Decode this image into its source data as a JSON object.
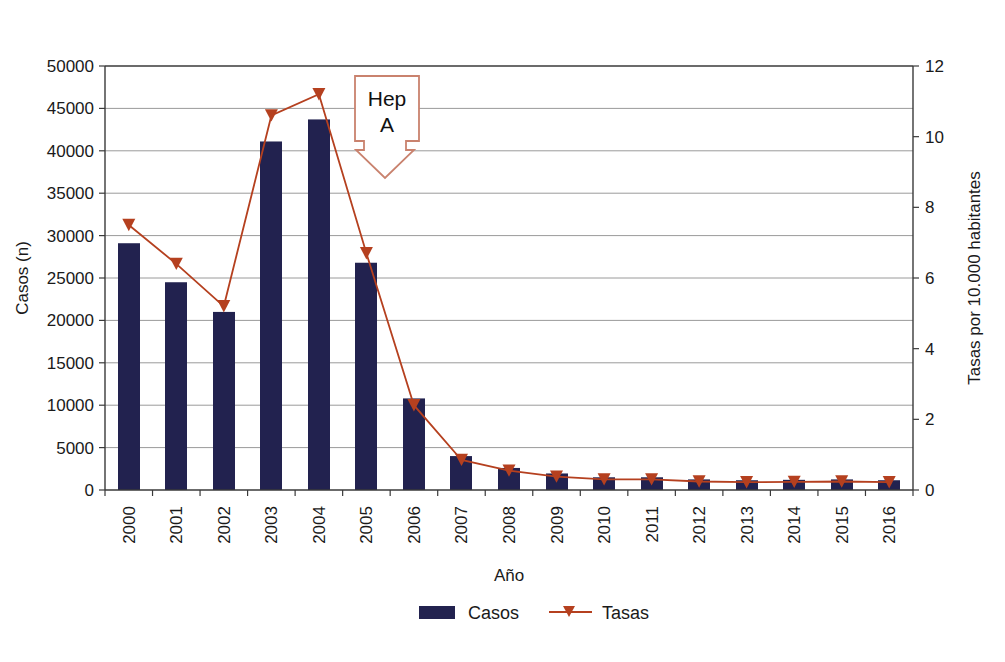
{
  "chart_data": {
    "type": "bar",
    "title": "",
    "subtitle": "",
    "xlabel": "Año",
    "ylabel": "Casos (n)",
    "y2label": "Tasas por 10.000 habitantes",
    "categories": [
      "2000",
      "2001",
      "2002",
      "2003",
      "2004",
      "2005",
      "2006",
      "2007",
      "2008",
      "2009",
      "2010",
      "2011",
      "2012",
      "2013",
      "2014",
      "2015",
      "2016"
    ],
    "ylim": [
      0,
      50000
    ],
    "yticks": [
      0,
      5000,
      10000,
      15000,
      20000,
      25000,
      30000,
      35000,
      40000,
      45000,
      50000
    ],
    "ytick_labels": [
      "0",
      "5000",
      "10000",
      "15000",
      "20000",
      "25000",
      "30000",
      "35000",
      "40000",
      "45000",
      "50000"
    ],
    "y2lim": [
      0,
      12
    ],
    "y2ticks": [
      0,
      2,
      4,
      6,
      8,
      10,
      12
    ],
    "y2tick_labels": [
      "0",
      "2",
      "4",
      "6",
      "8",
      "10",
      "12"
    ],
    "grid": true,
    "legend_position": "bottom",
    "series": [
      {
        "name": "Casos",
        "type": "bar",
        "axis": "left",
        "color": "#22224f",
        "values": [
          29100,
          24500,
          21000,
          41100,
          43700,
          26800,
          10800,
          4000,
          2600,
          1950,
          1500,
          1500,
          1250,
          1150,
          1200,
          1250,
          1150
        ]
      },
      {
        "name": "Tasas",
        "type": "line",
        "axis": "right",
        "color": "#b5401f",
        "marker": "triangle",
        "values": [
          7.5,
          6.4,
          5.2,
          10.6,
          11.2,
          6.7,
          2.4,
          0.85,
          0.55,
          0.38,
          0.3,
          0.3,
          0.24,
          0.22,
          0.23,
          0.24,
          0.22
        ]
      }
    ],
    "annotations": [
      {
        "name": "hep-a-callout",
        "text_line1": "Hep",
        "text_line2": "A",
        "shape": "down-arrow-callout",
        "border_color": "#c9826e",
        "fill_color": "#ffffff"
      }
    ]
  },
  "legend": {
    "items": [
      {
        "label": "Casos",
        "swatch": "bar-swatch",
        "color": "#22224f"
      },
      {
        "label": "Tasas",
        "swatch": "line-triangle-swatch",
        "color": "#b5401f"
      }
    ]
  },
  "colors": {
    "bar": "#22224f",
    "line": "#b5401f",
    "grid": "#9a9a9a",
    "axis": "#3a3a3a",
    "annotation_border": "#c9826e",
    "background": "#ffffff"
  }
}
